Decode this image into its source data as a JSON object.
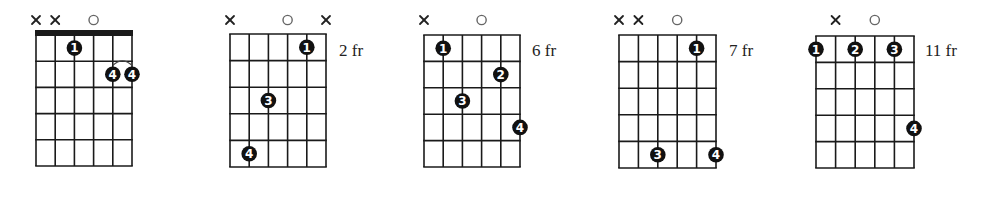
{
  "diagram": {
    "type": "guitar-chord-diagrams",
    "strings": 6,
    "frets_shown": 5,
    "colors": {
      "line": "#1a1a1a",
      "dot": "#111111",
      "dot_text": "#ffffff",
      "open_marker": "#666666"
    },
    "chords": [
      {
        "id": "chord-1",
        "fret_label": "",
        "nut": true,
        "markers": [
          {
            "string": 1,
            "type": "x",
            "label": "x"
          },
          {
            "string": 2,
            "type": "x",
            "label": "x"
          },
          {
            "string": 4,
            "type": "o",
            "label": "o"
          }
        ],
        "fingers": [
          {
            "string": 3,
            "fret": 1,
            "finger": "1"
          },
          {
            "string": 5,
            "fret": 2,
            "finger": "4"
          },
          {
            "string": 6,
            "fret": 2,
            "finger": "4"
          }
        ],
        "slur": {
          "from_string": 5,
          "to_string": 6,
          "fret": 2
        }
      },
      {
        "id": "chord-2",
        "fret_label": "2 fr",
        "nut": false,
        "markers": [
          {
            "string": 1,
            "type": "x",
            "label": "x"
          },
          {
            "string": 4,
            "type": "o",
            "label": "o"
          },
          {
            "string": 6,
            "type": "x",
            "label": "x"
          }
        ],
        "fingers": [
          {
            "string": 5,
            "fret": 1,
            "finger": "1"
          },
          {
            "string": 3,
            "fret": 3,
            "finger": "3"
          },
          {
            "string": 2,
            "fret": 5,
            "finger": "4"
          }
        ]
      },
      {
        "id": "chord-3",
        "fret_label": "6 fr",
        "nut": false,
        "markers": [
          {
            "string": 1,
            "type": "x",
            "label": "x"
          },
          {
            "string": 4,
            "type": "o",
            "label": "o"
          }
        ],
        "fingers": [
          {
            "string": 2,
            "fret": 1,
            "finger": "1"
          },
          {
            "string": 5,
            "fret": 2,
            "finger": "2"
          },
          {
            "string": 3,
            "fret": 3,
            "finger": "3"
          },
          {
            "string": 6,
            "fret": 4,
            "finger": "4"
          }
        ]
      },
      {
        "id": "chord-4",
        "fret_label": "7 fr",
        "nut": false,
        "markers": [
          {
            "string": 1,
            "type": "x",
            "label": "x"
          },
          {
            "string": 2,
            "type": "x",
            "label": "x"
          },
          {
            "string": 4,
            "type": "o",
            "label": "o"
          }
        ],
        "fingers": [
          {
            "string": 5,
            "fret": 1,
            "finger": "1"
          },
          {
            "string": 3,
            "fret": 5,
            "finger": "3"
          },
          {
            "string": 6,
            "fret": 5,
            "finger": "4"
          }
        ]
      },
      {
        "id": "chord-5",
        "fret_label": "11 fr",
        "nut": false,
        "markers": [
          {
            "string": 2,
            "type": "x",
            "label": "x"
          },
          {
            "string": 4,
            "type": "o",
            "label": "o"
          }
        ],
        "fingers": [
          {
            "string": 1,
            "fret": 1,
            "finger": "1"
          },
          {
            "string": 3,
            "fret": 1,
            "finger": "2"
          },
          {
            "string": 5,
            "fret": 1,
            "finger": "3"
          },
          {
            "string": 6,
            "fret": 4,
            "finger": "4"
          }
        ]
      }
    ]
  },
  "labels": {
    "chord_2_fret": "2 fr",
    "chord_3_fret": "6 fr",
    "chord_4_fret": "7 fr",
    "chord_5_fret": "11 fr"
  }
}
